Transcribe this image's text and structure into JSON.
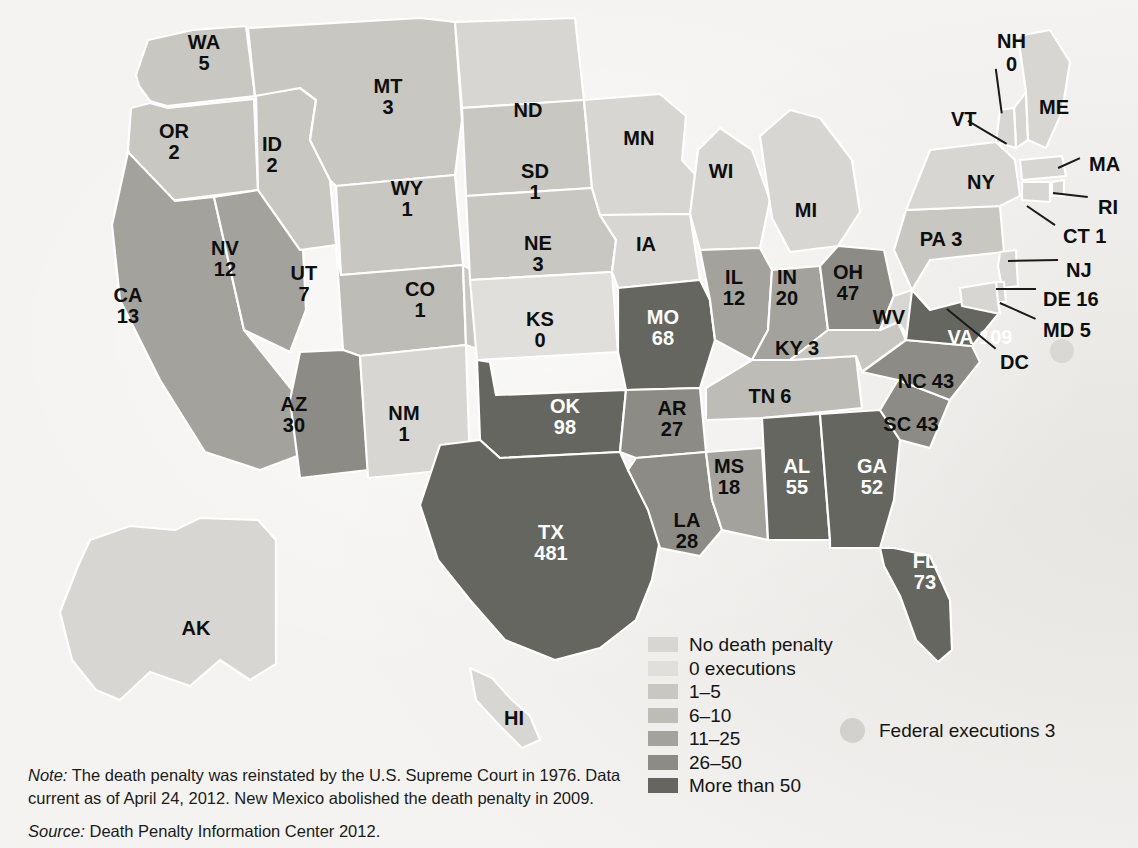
{
  "chart_data": {
    "type": "map",
    "value_label": "executions",
    "legend_position": "bottom-center",
    "states": [
      {
        "abbr": "WA",
        "value": "5",
        "bin": "1-5",
        "x": 204,
        "y": 53
      },
      {
        "abbr": "OR",
        "value": "2",
        "bin": "1-5",
        "x": 174,
        "y": 142
      },
      {
        "abbr": "CA",
        "value": "13",
        "bin": "11-25",
        "x": 128,
        "y": 306
      },
      {
        "abbr": "NV",
        "value": "12",
        "bin": "11-25",
        "x": 225,
        "y": 259
      },
      {
        "abbr": "ID",
        "value": "2",
        "bin": "1-5",
        "x": 272,
        "y": 155
      },
      {
        "abbr": "MT",
        "value": "3",
        "bin": "1-5",
        "x": 388,
        "y": 97
      },
      {
        "abbr": "WY",
        "value": "1",
        "bin": "1-5",
        "x": 407,
        "y": 199
      },
      {
        "abbr": "UT",
        "value": "7",
        "bin": "6-10",
        "x": 304,
        "y": 284
      },
      {
        "abbr": "AZ",
        "value": "30",
        "bin": "26-50",
        "x": 294,
        "y": 415
      },
      {
        "abbr": "CO",
        "value": "1",
        "bin": "1-5",
        "x": 420,
        "y": 300
      },
      {
        "abbr": "NM",
        "value": "1",
        "bin": "no-penalty",
        "x": 404,
        "y": 424
      },
      {
        "abbr": "ND",
        "value": "",
        "bin": "no-penalty",
        "x": 528,
        "y": 110
      },
      {
        "abbr": "SD",
        "value": "1",
        "bin": "1-5",
        "x": 535,
        "y": 182
      },
      {
        "abbr": "NE",
        "value": "3",
        "bin": "1-5",
        "x": 538,
        "y": 254
      },
      {
        "abbr": "KS",
        "value": "0",
        "bin": "0-exec",
        "x": 540,
        "y": 330
      },
      {
        "abbr": "OK",
        "value": "98",
        "bin": "more-50",
        "x": 565,
        "y": 417
      },
      {
        "abbr": "TX",
        "value": "481",
        "bin": "more-50",
        "x": 551,
        "y": 543
      },
      {
        "abbr": "MN",
        "value": "",
        "bin": "no-penalty",
        "x": 639,
        "y": 138
      },
      {
        "abbr": "IA",
        "value": "",
        "bin": "no-penalty",
        "x": 646,
        "y": 244
      },
      {
        "abbr": "MO",
        "value": "68",
        "bin": "more-50",
        "x": 663,
        "y": 328
      },
      {
        "abbr": "AR",
        "value": "27",
        "bin": "26-50",
        "x": 672,
        "y": 419
      },
      {
        "abbr": "LA",
        "value": "28",
        "bin": "26-50",
        "x": 687,
        "y": 531
      },
      {
        "abbr": "WI",
        "value": "",
        "bin": "no-penalty",
        "x": 721,
        "y": 171
      },
      {
        "abbr": "IL",
        "value": "12",
        "bin": "11-25",
        "x": 734,
        "y": 288
      },
      {
        "abbr": "MS",
        "value": "18",
        "bin": "11-25",
        "x": 729,
        "y": 477
      },
      {
        "abbr": "MI",
        "value": "",
        "bin": "no-penalty",
        "x": 806,
        "y": 210
      },
      {
        "abbr": "IN",
        "value": "20",
        "bin": "11-25",
        "x": 787,
        "y": 288
      },
      {
        "abbr": "TN",
        "value": "6",
        "bin": "6-10",
        "x": 770,
        "y": 396
      },
      {
        "abbr": "AL",
        "value": "55",
        "bin": "more-50",
        "x": 797,
        "y": 477
      },
      {
        "abbr": "OH",
        "value": "47",
        "bin": "26-50",
        "x": 848,
        "y": 283
      },
      {
        "abbr": "KY",
        "value": "3",
        "bin": "1-5",
        "x": 797,
        "y": 348
      },
      {
        "abbr": "GA",
        "value": "52",
        "bin": "more-50",
        "x": 872,
        "y": 477
      },
      {
        "abbr": "WV",
        "value": "",
        "bin": "no-penalty",
        "x": 889,
        "y": 317
      },
      {
        "abbr": "SC",
        "value": "43",
        "bin": "26-50",
        "x": 911,
        "y": 424
      },
      {
        "abbr": "NC",
        "value": "43",
        "bin": "26-50",
        "x": 926,
        "y": 381
      },
      {
        "abbr": "VA",
        "value": "109",
        "bin": "more-50",
        "x": 980,
        "y": 337
      },
      {
        "abbr": "FL",
        "value": "73",
        "bin": "more-50",
        "x": 925,
        "y": 572
      },
      {
        "abbr": "PA",
        "value": "3",
        "bin": "1-5",
        "x": 941,
        "y": 239
      },
      {
        "abbr": "NY",
        "value": "",
        "bin": "no-penalty",
        "x": 981,
        "y": 182
      },
      {
        "abbr": "AK",
        "value": "",
        "bin": "no-penalty",
        "x": 196,
        "y": 628
      },
      {
        "abbr": "HI",
        "value": "",
        "bin": "no-penalty",
        "x": 514,
        "y": 718
      }
    ],
    "callouts": [
      {
        "abbr": "NH",
        "value": "0",
        "lx": 997,
        "ly": 30,
        "x1": 996,
        "y1": 68,
        "x2": 1002,
        "y2": 113
      },
      {
        "abbr": "VT",
        "value": "",
        "lx": 951,
        "ly": 108,
        "x1": 968,
        "y1": 120,
        "x2": 1007,
        "y2": 143
      },
      {
        "abbr": "ME",
        "value": "",
        "lx": 1039,
        "ly": 96,
        "x1": null,
        "y1": null,
        "x2": null,
        "y2": null
      },
      {
        "abbr": "MA",
        "value": "",
        "lx": 1089,
        "ly": 153,
        "x1": 1058,
        "y1": 167,
        "x2": 1080,
        "y2": 157
      },
      {
        "abbr": "RI",
        "value": "",
        "lx": 1098,
        "ly": 196,
        "x1": 1053,
        "y1": 192,
        "x2": 1088,
        "y2": 196
      },
      {
        "abbr": "CT",
        "value": "1",
        "lx": 1063,
        "ly": 225,
        "x1": 1027,
        "y1": 205,
        "x2": 1055,
        "y2": 224
      },
      {
        "abbr": "NJ",
        "value": "",
        "lx": 1066,
        "ly": 259,
        "x1": 1008,
        "y1": 260,
        "x2": 1058,
        "y2": 259
      },
      {
        "abbr": "DE",
        "value": "16",
        "lx": 1043,
        "ly": 288,
        "x1": 996,
        "y1": 288,
        "x2": 1036,
        "y2": 288
      },
      {
        "abbr": "MD",
        "value": "5",
        "lx": 1043,
        "ly": 319,
        "x1": 1000,
        "y1": 302,
        "x2": 1036,
        "y2": 318
      },
      {
        "abbr": "DC",
        "value": "",
        "lx": 1000,
        "ly": 351,
        "x1": 947,
        "y1": 308,
        "x2": 996,
        "y2": 348
      }
    ],
    "legend": {
      "items": [
        {
          "label": "No death penalty",
          "color": "#d7d6d2",
          "bin": "no-penalty"
        },
        {
          "label": "0 executions",
          "color": "#e0dfdb",
          "bin": "0-exec"
        },
        {
          "label": "1–5",
          "color": "#c8c7c2",
          "bin": "1-5"
        },
        {
          "label": "6–10",
          "color": "#bdbcb6",
          "bin": "6-10"
        },
        {
          "label": "11–25",
          "color": "#a3a29c",
          "bin": "11-25"
        },
        {
          "label": "26–50",
          "color": "#8c8b85",
          "bin": "26-50"
        },
        {
          "label": "More than 50",
          "color": "#666660",
          "bin": "more-50"
        }
      ],
      "federal": {
        "label": "Federal executions 3",
        "marker_color": "#d2d1cd"
      }
    }
  },
  "notes": {
    "note_lead": "Note:",
    "note_text": " The death penalty was reinstated by the U.S. Supreme Court in 1976. Data current as of April 24, 2012. New Mexico abolished the death penalty in 2009.",
    "source_lead": "Source:",
    "source_text": " Death Penalty Information Center 2012."
  }
}
